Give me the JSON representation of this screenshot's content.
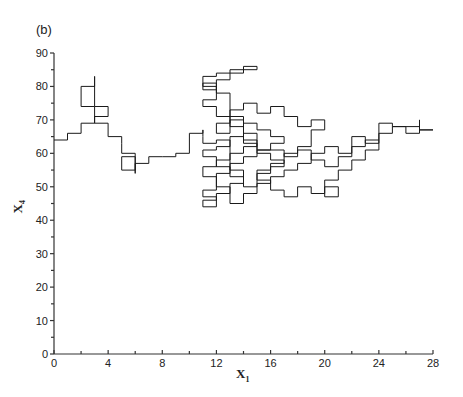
{
  "chart_data": {
    "type": "line",
    "style": "step-trajectory",
    "panel_label": "(b)",
    "title": "",
    "xlabel": "X",
    "xlabel_sub": "1",
    "ylabel": "X",
    "ylabel_sub": "4",
    "xlim": [
      0,
      28
    ],
    "ylim": [
      0,
      90
    ],
    "xticks_major": [
      0,
      4,
      8,
      12,
      16,
      20,
      24,
      28
    ],
    "xticks_minor": [
      2,
      6,
      10,
      14,
      18,
      22,
      26
    ],
    "yticks_major": [
      0,
      10,
      20,
      30,
      40,
      50,
      60,
      70,
      80,
      90
    ],
    "yticks_minor": [
      5,
      15,
      25,
      35,
      45,
      55,
      65,
      75,
      85
    ],
    "grid": false,
    "legend": null,
    "line_color": "#1a1a1a",
    "path": [
      [
        0,
        64
      ],
      [
        1,
        64
      ],
      [
        1,
        66
      ],
      [
        2,
        66
      ],
      [
        2,
        69
      ],
      [
        3,
        69
      ],
      [
        3,
        74
      ],
      [
        2,
        74
      ],
      [
        2,
        80
      ],
      [
        3,
        80
      ],
      [
        3,
        83
      ],
      [
        3,
        74
      ],
      [
        4,
        74
      ],
      [
        4,
        71
      ],
      [
        3,
        71
      ],
      [
        3,
        69
      ],
      [
        4,
        69
      ],
      [
        4,
        65
      ],
      [
        5,
        65
      ],
      [
        5,
        63
      ],
      [
        5,
        60
      ],
      [
        6,
        60
      ],
      [
        6,
        55
      ],
      [
        5,
        55
      ],
      [
        5,
        59
      ],
      [
        6,
        59
      ],
      [
        6,
        54
      ],
      [
        6,
        57
      ],
      [
        7,
        57
      ],
      [
        7,
        59
      ],
      [
        8,
        59
      ],
      [
        9,
        59
      ],
      [
        9,
        60
      ],
      [
        10,
        60
      ],
      [
        10,
        66
      ],
      [
        11,
        66
      ],
      [
        11,
        67
      ],
      [
        11,
        65
      ],
      [
        11,
        63
      ],
      [
        12,
        63
      ],
      [
        12,
        64
      ],
      [
        13,
        64
      ],
      [
        13,
        58
      ],
      [
        12,
        58
      ],
      [
        12,
        56
      ],
      [
        11,
        56
      ],
      [
        11,
        53
      ],
      [
        12,
        53
      ],
      [
        12,
        49
      ],
      [
        11,
        49
      ],
      [
        11,
        47
      ],
      [
        12,
        47
      ],
      [
        12,
        44
      ],
      [
        11,
        44
      ],
      [
        11,
        46
      ],
      [
        12,
        46
      ],
      [
        12,
        48
      ],
      [
        13,
        48
      ],
      [
        13,
        51
      ],
      [
        14,
        51
      ],
      [
        14,
        55
      ],
      [
        13,
        55
      ],
      [
        13,
        60
      ],
      [
        14,
        60
      ],
      [
        14,
        62
      ],
      [
        15,
        62
      ],
      [
        15,
        66
      ],
      [
        14,
        66
      ],
      [
        14,
        70
      ],
      [
        13,
        70
      ],
      [
        13,
        66
      ],
      [
        12,
        66
      ],
      [
        12,
        69
      ],
      [
        13,
        69
      ],
      [
        13,
        73
      ],
      [
        14,
        73
      ],
      [
        14,
        75
      ],
      [
        15,
        75
      ],
      [
        15,
        72
      ],
      [
        16,
        72
      ],
      [
        16,
        74
      ],
      [
        17,
        74
      ],
      [
        17,
        71
      ],
      [
        18,
        71
      ],
      [
        18,
        68
      ],
      [
        19,
        68
      ],
      [
        19,
        70
      ],
      [
        20,
        70
      ],
      [
        20,
        67
      ],
      [
        19,
        67
      ],
      [
        19,
        62
      ],
      [
        18,
        62
      ],
      [
        18,
        60
      ],
      [
        17,
        60
      ],
      [
        17,
        57
      ],
      [
        16,
        57
      ],
      [
        16,
        55
      ],
      [
        15,
        55
      ],
      [
        15,
        52
      ],
      [
        16,
        52
      ],
      [
        16,
        49
      ],
      [
        17,
        49
      ],
      [
        17,
        47
      ],
      [
        18,
        47
      ],
      [
        18,
        50
      ],
      [
        19,
        50
      ],
      [
        19,
        48
      ],
      [
        20,
        48
      ],
      [
        20,
        50
      ],
      [
        21,
        50
      ],
      [
        21,
        47
      ],
      [
        20,
        47
      ],
      [
        20,
        52
      ],
      [
        21,
        52
      ],
      [
        21,
        55
      ],
      [
        22,
        55
      ],
      [
        22,
        58
      ],
      [
        23,
        58
      ],
      [
        23,
        61
      ],
      [
        24,
        61
      ],
      [
        24,
        66
      ],
      [
        25,
        66
      ],
      [
        25,
        68
      ],
      [
        26,
        68
      ],
      [
        26,
        66
      ],
      [
        27,
        66
      ],
      [
        27,
        70
      ],
      [
        27,
        67
      ],
      [
        28,
        67
      ],
      [
        27,
        67
      ],
      [
        27,
        68
      ],
      [
        25,
        68
      ],
      [
        25,
        69
      ],
      [
        24,
        69
      ],
      [
        24,
        63
      ],
      [
        23,
        63
      ],
      [
        23,
        65
      ],
      [
        22,
        65
      ],
      [
        22,
        60
      ],
      [
        21,
        60
      ],
      [
        21,
        62
      ],
      [
        20,
        62
      ],
      [
        20,
        60
      ],
      [
        19,
        60
      ],
      [
        19,
        57
      ],
      [
        18,
        57
      ],
      [
        18,
        55
      ],
      [
        17,
        55
      ],
      [
        17,
        53
      ],
      [
        16,
        53
      ],
      [
        16,
        51
      ],
      [
        15,
        51
      ],
      [
        15,
        48
      ],
      [
        14,
        48
      ],
      [
        14,
        45
      ],
      [
        13,
        45
      ],
      [
        13,
        50
      ],
      [
        12,
        50
      ],
      [
        12,
        54
      ],
      [
        13,
        54
      ],
      [
        13,
        57
      ],
      [
        14,
        57
      ],
      [
        14,
        59
      ],
      [
        15,
        59
      ],
      [
        15,
        61
      ],
      [
        16,
        61
      ],
      [
        16,
        63
      ],
      [
        17,
        63
      ],
      [
        17,
        65
      ],
      [
        16,
        65
      ],
      [
        16,
        67
      ],
      [
        15,
        67
      ],
      [
        15,
        69
      ],
      [
        14,
        69
      ],
      [
        14,
        71
      ],
      [
        13,
        71
      ],
      [
        13,
        78
      ],
      [
        12,
        78
      ],
      [
        12,
        80
      ],
      [
        11,
        80
      ],
      [
        11,
        83
      ],
      [
        12,
        83
      ],
      [
        12,
        84
      ],
      [
        14,
        84
      ],
      [
        14,
        86
      ],
      [
        15,
        86
      ],
      [
        15,
        85
      ],
      [
        13,
        85
      ],
      [
        13,
        82
      ],
      [
        12,
        82
      ],
      [
        12,
        79
      ],
      [
        11,
        79
      ],
      [
        11,
        81
      ],
      [
        12,
        81
      ],
      [
        12,
        76
      ],
      [
        11,
        76
      ],
      [
        11,
        74
      ],
      [
        12,
        74
      ],
      [
        12,
        71
      ],
      [
        13,
        71
      ],
      [
        13,
        68
      ],
      [
        14,
        68
      ],
      [
        14,
        64
      ],
      [
        15,
        64
      ],
      [
        15,
        60
      ],
      [
        16,
        60
      ],
      [
        16,
        58
      ],
      [
        17,
        58
      ],
      [
        17,
        56
      ],
      [
        16,
        56
      ],
      [
        16,
        54
      ],
      [
        15,
        54
      ],
      [
        15,
        50
      ],
      [
        14,
        50
      ],
      [
        14,
        53
      ],
      [
        13,
        53
      ],
      [
        13,
        56
      ],
      [
        12,
        56
      ],
      [
        12,
        59
      ],
      [
        11,
        59
      ],
      [
        11,
        61
      ],
      [
        12,
        61
      ],
      [
        12,
        62
      ],
      [
        13,
        62
      ],
      [
        13,
        65
      ],
      [
        14,
        65
      ],
      [
        14,
        63
      ],
      [
        15,
        63
      ],
      [
        15,
        61
      ],
      [
        17,
        61
      ],
      [
        17,
        59
      ],
      [
        18,
        59
      ],
      [
        18,
        61
      ],
      [
        19,
        61
      ],
      [
        19,
        58
      ],
      [
        20,
        58
      ],
      [
        20,
        56
      ],
      [
        21,
        56
      ],
      [
        21,
        59
      ],
      [
        22,
        59
      ],
      [
        22,
        62
      ],
      [
        23,
        62
      ],
      [
        23,
        64
      ],
      [
        24,
        64
      ]
    ]
  }
}
